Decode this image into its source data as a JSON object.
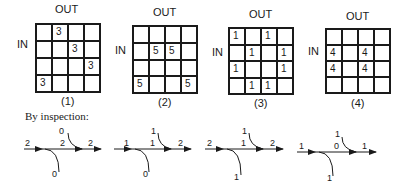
{
  "matrices": [
    {
      "id": "1",
      "out_label": "OUT",
      "in_label": "IN",
      "caption": "(1)",
      "cells": [
        [
          "",
          "3",
          "",
          ""
        ],
        [
          "",
          "",
          "3",
          ""
        ],
        [
          "",
          "",
          "",
          "3"
        ],
        [
          "3",
          "",
          "",
          ""
        ]
      ]
    },
    {
      "id": "2",
      "out_label": "OUT",
      "in_label": "IN",
      "caption": "(2)",
      "cells": [
        [
          "",
          "",
          "",
          ""
        ],
        [
          "",
          "5",
          "5",
          ""
        ],
        [
          "",
          "",
          "",
          ""
        ],
        [
          "5",
          "",
          "",
          "5"
        ]
      ]
    },
    {
      "id": "3",
      "out_label": "OUT",
      "in_label": "IN",
      "caption": "(3)",
      "cells": [
        [
          "1",
          "",
          "1",
          ""
        ],
        [
          "",
          "1",
          "",
          "1"
        ],
        [
          "1",
          "",
          "",
          "1"
        ],
        [
          "",
          "1",
          "1",
          ""
        ]
      ]
    },
    {
      "id": "4",
      "out_label": "OUT",
      "in_label": "IN",
      "caption": "(4)",
      "cells": [
        [
          "",
          "",
          "",
          ""
        ],
        [
          "4",
          "",
          "4",
          ""
        ],
        [
          "4",
          "",
          "4",
          ""
        ],
        [
          "",
          "",
          "",
          ""
        ]
      ]
    }
  ],
  "inspection_heading": "By inspection:",
  "flow_diagrams": [
    {
      "in": "2",
      "middle": "2",
      "out": "2",
      "top": "0",
      "bottom": "0"
    },
    {
      "in": "1",
      "middle": "1",
      "out": "2",
      "top": "1",
      "bottom": "0"
    },
    {
      "in": "2",
      "middle": "1",
      "out": "2",
      "top": "1",
      "bottom": "1"
    },
    {
      "in": "1",
      "middle": "0",
      "out": "1",
      "top": "1",
      "bottom": "1"
    }
  ]
}
